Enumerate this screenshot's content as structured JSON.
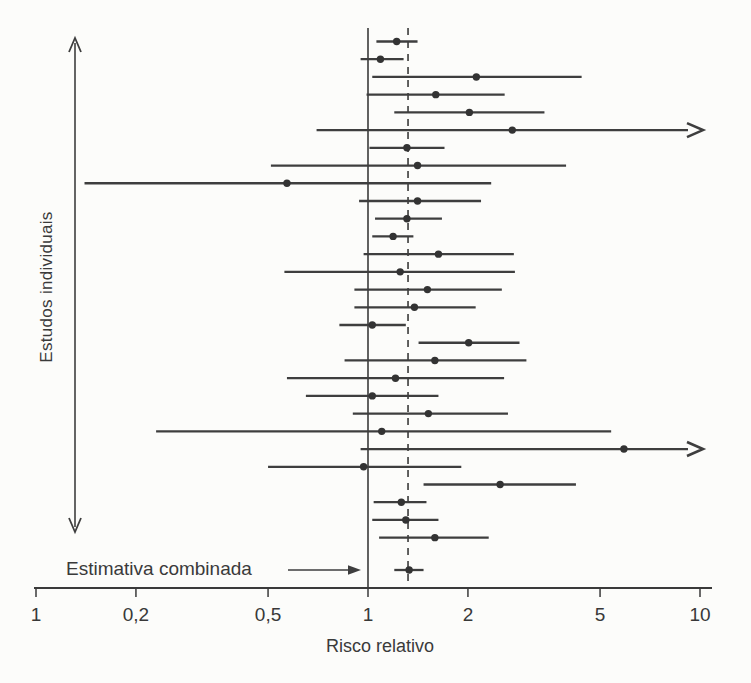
{
  "chart_data": {
    "type": "forest",
    "xscale": "log10",
    "xlabel": "Risco relativo",
    "y_axis_label": "Estudos individuais",
    "combined_label": "Estimativa combinada",
    "x_ticks": [
      {
        "value": 0.1,
        "label": "1"
      },
      {
        "value": 0.2,
        "label": "0,2"
      },
      {
        "value": 0.5,
        "label": "0,5"
      },
      {
        "value": 1,
        "label": "1"
      },
      {
        "value": 2,
        "label": "2"
      },
      {
        "value": 5,
        "label": "5"
      },
      {
        "value": 10,
        "label": "10"
      }
    ],
    "x_range": [
      0.1,
      10
    ],
    "grid": false,
    "reference_lines": {
      "solid_at": 1.0,
      "dashed_at": 1.32
    },
    "studies": [
      {
        "lo": 1.06,
        "rr": 1.22,
        "hi": 1.41,
        "arrow_right": false
      },
      {
        "lo": 0.95,
        "rr": 1.09,
        "hi": 1.28,
        "arrow_right": false
      },
      {
        "lo": 1.03,
        "rr": 2.12,
        "hi": 4.4,
        "arrow_right": false
      },
      {
        "lo": 0.99,
        "rr": 1.6,
        "hi": 2.58,
        "arrow_right": false
      },
      {
        "lo": 1.2,
        "rr": 2.02,
        "hi": 3.4,
        "arrow_right": false
      },
      {
        "lo": 0.7,
        "rr": 2.72,
        "hi": null,
        "arrow_right": true
      },
      {
        "lo": 1.01,
        "rr": 1.31,
        "hi": 1.7,
        "arrow_right": false
      },
      {
        "lo": 0.51,
        "rr": 1.41,
        "hi": 3.95,
        "arrow_right": false
      },
      {
        "lo": 0.14,
        "rr": 0.57,
        "hi": 2.35,
        "arrow_right": false
      },
      {
        "lo": 0.94,
        "rr": 1.41,
        "hi": 2.19,
        "arrow_right": false
      },
      {
        "lo": 1.05,
        "rr": 1.31,
        "hi": 1.67,
        "arrow_right": false
      },
      {
        "lo": 1.03,
        "rr": 1.19,
        "hi": 1.37,
        "arrow_right": false
      },
      {
        "lo": 0.97,
        "rr": 1.63,
        "hi": 2.75,
        "arrow_right": false
      },
      {
        "lo": 0.56,
        "rr": 1.25,
        "hi": 2.77,
        "arrow_right": false
      },
      {
        "lo": 0.91,
        "rr": 1.51,
        "hi": 2.53,
        "arrow_right": false
      },
      {
        "lo": 0.91,
        "rr": 1.38,
        "hi": 2.11,
        "arrow_right": false
      },
      {
        "lo": 0.82,
        "rr": 1.03,
        "hi": 1.3,
        "arrow_right": false
      },
      {
        "lo": 1.42,
        "rr": 2.01,
        "hi": 2.86,
        "arrow_right": false
      },
      {
        "lo": 0.85,
        "rr": 1.59,
        "hi": 3.0,
        "arrow_right": false
      },
      {
        "lo": 0.57,
        "rr": 1.21,
        "hi": 2.57,
        "arrow_right": false
      },
      {
        "lo": 0.65,
        "rr": 1.03,
        "hi": 1.63,
        "arrow_right": false
      },
      {
        "lo": 0.9,
        "rr": 1.52,
        "hi": 2.64,
        "arrow_right": false
      },
      {
        "lo": 0.23,
        "rr": 1.1,
        "hi": 5.4,
        "arrow_right": false
      },
      {
        "lo": 0.95,
        "rr": 5.9,
        "hi": null,
        "arrow_right": true
      },
      {
        "lo": 0.5,
        "rr": 0.97,
        "hi": 1.91,
        "arrow_right": false
      },
      {
        "lo": 1.47,
        "rr": 2.5,
        "hi": 4.23,
        "arrow_right": false
      },
      {
        "lo": 1.04,
        "rr": 1.26,
        "hi": 1.5,
        "arrow_right": false
      },
      {
        "lo": 1.03,
        "rr": 1.3,
        "hi": 1.63,
        "arrow_right": false
      },
      {
        "lo": 1.08,
        "rr": 1.59,
        "hi": 2.31,
        "arrow_right": false
      }
    ],
    "combined": {
      "lo": 1.2,
      "rr": 1.33,
      "hi": 1.47
    }
  },
  "colors": {
    "line": "#3e3e3e",
    "dot": "#333333",
    "axis": "#3a3a3a",
    "text": "#3a3a3a",
    "background": "#fcfcfa"
  }
}
